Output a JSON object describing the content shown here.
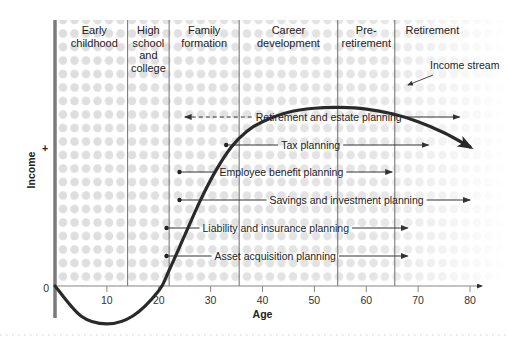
{
  "chart_data": {
    "type": "line",
    "title": "",
    "xlabel": "Age",
    "ylabel": "Income",
    "ylabel_sign": "+",
    "origin_label": "0",
    "xlim": [
      0,
      80
    ],
    "x_ticks": [
      10,
      20,
      30,
      40,
      50,
      60,
      70,
      80
    ],
    "life_stages": [
      {
        "label_lines": [
          "Early",
          "childhood"
        ],
        "start": 0,
        "end": 14
      },
      {
        "label_lines": [
          "High",
          "school",
          "and",
          "college"
        ],
        "start": 14,
        "end": 22
      },
      {
        "label_lines": [
          "Family",
          "formation"
        ],
        "start": 22,
        "end": 35.5
      },
      {
        "label_lines": [
          "Career",
          "development"
        ],
        "start": 35.5,
        "end": 54.5
      },
      {
        "label_lines": [
          "Pre-",
          "retirement"
        ],
        "start": 54.5,
        "end": 65.5
      },
      {
        "label_lines": [
          "Retirement"
        ],
        "start": 65.5,
        "end": 80
      }
    ],
    "series": [
      {
        "name": "Income stream",
        "x": [
          0,
          5,
          10,
          15,
          20,
          22,
          25,
          28,
          31,
          34,
          37,
          40,
          45,
          50,
          55,
          60,
          65,
          70,
          75,
          80
        ],
        "y": [
          0,
          -1.9,
          -2.4,
          -1.9,
          -0.3,
          1.0,
          3.2,
          5.4,
          7.3,
          8.8,
          9.8,
          10.4,
          11.0,
          11.25,
          11.3,
          11.2,
          10.9,
          10.4,
          9.7,
          8.8
        ]
      }
    ],
    "annotations": [
      {
        "text": "Income stream",
        "type": "callout",
        "points_to_age": 68
      }
    ],
    "planning_items": [
      {
        "label": "Retirement and estate planning",
        "start_age": 36,
        "end_age": 78,
        "dashed_back_to": 25,
        "level": 6
      },
      {
        "label": "Tax planning",
        "start_age": 33,
        "end_age": 72,
        "level": 5
      },
      {
        "label": "Employee benefit planning",
        "start_age": 24,
        "end_age": 65,
        "level": 4
      },
      {
        "label": "Savings and investment planning",
        "start_age": 24,
        "end_age": 80,
        "level": 3
      },
      {
        "label": "Liability and insurance planning",
        "start_age": 21.5,
        "end_age": 68,
        "level": 2
      },
      {
        "label": "Asset acquisition planning",
        "start_age": 21.5,
        "end_age": 68,
        "level": 1
      }
    ],
    "grid": false,
    "colors": {
      "curve": "#2a2a2a",
      "axis": "#7a7a7a",
      "dots": "#dcdcdc",
      "divider": "#6e6e6e"
    }
  }
}
